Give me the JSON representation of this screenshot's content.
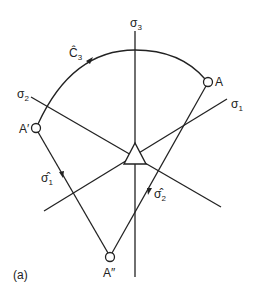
{
  "figure": {
    "panel_label": "(a)",
    "axes": {
      "sigma1": {
        "label": "σ",
        "sub": "1"
      },
      "sigma2": {
        "label": "σ",
        "sub": "2"
      },
      "sigma3": {
        "label": "σ",
        "sub": "3"
      }
    },
    "points": {
      "A": {
        "label": "A"
      },
      "A_prime": {
        "label": "A′"
      },
      "A_double_prime": {
        "label": "A″"
      }
    },
    "operators": {
      "c3": {
        "label": "Ĉ",
        "sub": "3"
      },
      "sigma1_hat": {
        "label": "σ̂",
        "sub": "1"
      },
      "sigma2_hat": {
        "label": "σ̂",
        "sub": "2"
      }
    },
    "colors": {
      "stroke": "#222222",
      "background": "#ffffff"
    }
  }
}
